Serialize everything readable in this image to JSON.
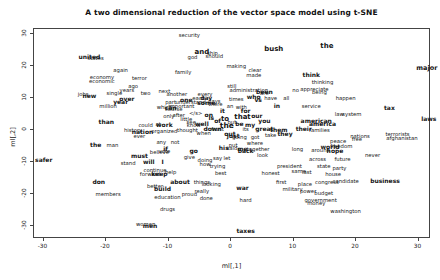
{
  "chart": {
    "title": "A two dimensional reduction of the vector space model using t-SNE",
    "x_axis_label": "ml[,1]",
    "y_axis_label": "ml[,2]"
  },
  "chart_data": {
    "type": "scatter",
    "title": "A two dimensional reduction of the vector space model using t-SNE",
    "xlabel": "ml[,1]",
    "ylabel": "ml[,2]",
    "xlim": [
      -31.5,
      32
    ],
    "ylim": [
      -33,
      31
    ],
    "x_ticks": [
      -30,
      -20,
      -10,
      0,
      10,
      20,
      30
    ],
    "y_ticks": [
      30,
      20,
      10,
      0,
      -10,
      -20,
      -30
    ],
    "grid": false,
    "legend": "none",
    "point_style": "word-labels",
    "points": [
      [
        "security",
        -6.5,
        29,
        0
      ],
      [
        "united",
        -22.5,
        22.5,
        1
      ],
      [
        "states",
        -21.5,
        22,
        0
      ],
      [
        "again",
        -17.5,
        18,
        0
      ],
      [
        "economy",
        -20.5,
        16,
        0
      ],
      [
        "economic",
        -20.5,
        14.8,
        0
      ],
      [
        "terror",
        -14.5,
        15.5,
        0
      ],
      [
        "and",
        -4.5,
        24,
        1,
        7
      ],
      [
        "god",
        -6,
        22.3,
        0
      ],
      [
        "ship",
        -2.8,
        23.5,
        0
      ],
      [
        "should",
        -2.5,
        22.4,
        0
      ],
      [
        "bush",
        7,
        25,
        1,
        7
      ],
      [
        "making",
        1,
        19.5,
        0
      ],
      [
        "clear",
        4,
        18,
        0
      ],
      [
        "made",
        3.8,
        16.5,
        0
      ],
      [
        "the",
        15.5,
        26,
        1,
        7
      ],
      [
        "major",
        31.5,
        19,
        1,
        6.5
      ],
      [
        "family",
        -7.5,
        17.5,
        0
      ],
      [
        "every",
        -4,
        10.5,
        0
      ],
      [
        "each",
        -5,
        9.5,
        0
      ],
      [
        "day",
        -3.8,
        9.8,
        1
      ],
      [
        "days",
        -2.5,
        8.5,
        0
      ],
      [
        "times",
        1,
        9,
        0
      ],
      [
        "vs",
        4.5,
        9,
        1
      ],
      [
        "next",
        -10.5,
        11.5,
        0
      ],
      [
        "another",
        -8.5,
        10.5,
        0
      ],
      [
        "one",
        -7,
        9,
        1
      ],
      [
        "important",
        -7.8,
        7,
        0
      ],
      [
        "can",
        -9.5,
        6.5,
        1
      ],
      [
        "still",
        0.3,
        13,
        0
      ],
      [
        "administration",
        3,
        12,
        0
      ],
      [
        "been",
        5.5,
        11.5,
        1
      ],
      [
        "no",
        10.5,
        12,
        0
      ],
      [
        "are",
        5.5,
        11,
        0
      ],
      [
        "who",
        3.8,
        10,
        1
      ],
      [
        "have",
        6.5,
        9.5,
        0
      ],
      [
        "all",
        9,
        9.5,
        0
      ],
      [
        "in",
        7.5,
        7.3,
        1
      ],
      [
        "with",
        1.8,
        6.5,
        0
      ],
      [
        "jobs",
        -23.5,
        10.5,
        0
      ],
      [
        "new",
        -22.5,
        10.3,
        1
      ],
      [
        "single",
        -18.5,
        11,
        0
      ],
      [
        "years",
        -16.5,
        12,
        0
      ],
      [
        "ago",
        -15.5,
        13.2,
        0
      ],
      [
        "over",
        -16.5,
        9.5,
        1
      ],
      [
        "two",
        -13.5,
        11,
        0
      ],
      [
        "year",
        -17.5,
        8.3,
        1
      ],
      [
        "million",
        -19.5,
        6.8,
        0
      ],
      [
        "think",
        13,
        17,
        1
      ],
      [
        "thinking",
        14.8,
        14.5,
        0
      ],
      [
        "appreciate",
        13.5,
        12.3,
        0
      ],
      [
        "being",
        14.3,
        11.3,
        0
      ],
      [
        "happen",
        18.5,
        9.5,
        0
      ],
      [
        "tax",
        25.5,
        6.5,
        1
      ],
      [
        "service",
        13,
        7,
        0
      ],
      [
        "law",
        17.5,
        4.5,
        0
      ],
      [
        "system",
        19.5,
        4.5,
        0
      ],
      [
        "laws",
        31.8,
        3,
        1
      ],
      [
        "part",
        -9.5,
        8,
        0
      ],
      [
        "understand",
        -6.3,
        8,
        0
      ],
      [
        "some",
        -3.8,
        8.2,
        1
      ],
      [
        "there",
        -2.3,
        7.5,
        0
      ],
      [
        "an",
        0,
        6.8,
        0
      ],
      [
        "which",
        -10.5,
        6.7,
        0
      ],
      [
        "course",
        -9,
        5.8,
        0
      ],
      [
        "only",
        -9.8,
        3.8,
        0
      ],
      [
        "little",
        -7,
        2.8,
        0
      ],
      [
        "see",
        -6.2,
        2,
        0
      ],
      [
        "work",
        -10.5,
        1.2,
        1
      ],
      [
        "at",
        -11.5,
        1.4,
        0
      ],
      [
        "after",
        -8.2,
        4,
        0
      ],
      [
        "&lt;/s&gt;",
        -5.5,
        4.7,
        0
      ],
      [
        "on",
        -3.4,
        4.4,
        1
      ],
      [
        "it",
        -1.2,
        5.6,
        1
      ],
      [
        "for",
        2.5,
        5.7,
        1
      ],
      [
        "our",
        4.3,
        4.2,
        1
      ],
      [
        "you",
        5.5,
        2.6,
        1
      ],
      [
        "my",
        3.2,
        1.2,
        1
      ],
      [
        "be",
        1.5,
        1.6,
        1
      ],
      [
        "but",
        0.3,
        1.8,
        0
      ],
      [
        "to",
        -0.8,
        3.2,
        1,
        7
      ],
      [
        "that",
        2,
        3.8,
        1,
        7
      ],
      [
        "of",
        -2,
        2.6,
        1
      ],
      [
        "is",
        -3,
        3.4,
        1
      ],
      [
        "the",
        -0.5,
        0.8,
        1,
        7.5
      ],
      [
        "know",
        -5.8,
        0.8,
        0
      ],
      [
        "well",
        -4.5,
        1.5,
        1
      ],
      [
        "thought",
        -6.8,
        -0.6,
        0
      ],
      [
        "front",
        -2,
        -0.2,
        0
      ],
      [
        "down",
        -2.8,
        0,
        1
      ],
      [
        "its",
        2.5,
        -0.2,
        0
      ],
      [
        "great",
        5.5,
        0,
        1
      ],
      [
        "them",
        7.8,
        -0.3,
        1
      ],
      [
        "they",
        8.8,
        -1.5,
        1
      ],
      [
        "when",
        -4.2,
        -1.6,
        0
      ],
      [
        "just",
        0.5,
        -2.2,
        1
      ],
      [
        "out",
        0,
        -1.5,
        1
      ],
      [
        "going",
        1.5,
        -2.8,
        0
      ],
      [
        "got",
        4,
        -2.8,
        0
      ],
      [
        "take",
        6.5,
        -2.2,
        0
      ],
      [
        "where",
        4,
        -4.8,
        0
      ],
      [
        "his",
        -1,
        -6,
        1
      ],
      [
        "said",
        0.3,
        -6.3,
        0
      ],
      [
        "me",
        2,
        -6.2,
        1
      ],
      [
        "put",
        0.5,
        -5.2,
        0
      ],
      [
        "back",
        2.5,
        -6.8,
        1
      ],
      [
        "together",
        4.5,
        -6.6,
        0
      ],
      [
        "look",
        5.2,
        -8.3,
        0
      ],
      [
        "go",
        -5.8,
        -7,
        1
      ],
      [
        "vote",
        -10.5,
        -7.3,
        0
      ],
      [
        "give",
        -6.5,
        -9.2,
        0
      ],
      [
        "doing",
        -4,
        -10,
        0
      ],
      [
        "say",
        -2,
        -9.5,
        0
      ],
      [
        "let",
        -0.5,
        -9.5,
        0
      ],
      [
        "how",
        -4,
        -11.3,
        0
      ],
      [
        "trying",
        -2,
        -12,
        0
      ],
      [
        "best",
        -1.5,
        -14,
        0
      ],
      [
        "honest",
        6.5,
        -14,
        0
      ],
      [
        "first",
        8.2,
        -17,
        0
      ],
      [
        "same",
        11,
        -13.5,
        0
      ],
      [
        "last",
        12.3,
        -13.8,
        0
      ],
      [
        "place",
        12,
        -17.5,
        0
      ],
      [
        "power",
        12.5,
        -19.8,
        0
      ],
      [
        "military",
        10,
        -19.2,
        0
      ],
      [
        "war",
        2,
        -18.5,
        1
      ],
      [
        "hard",
        2.5,
        -22.5,
        0
      ],
      [
        "about",
        -8,
        -16.6,
        1
      ],
      [
        "things",
        -4.5,
        -16.8,
        0
      ],
      [
        "looking",
        -3,
        -17.4,
        0
      ],
      [
        "really",
        -4.5,
        -19.8,
        0
      ],
      [
        "done",
        -3.8,
        -21.8,
        0
      ],
      [
        "proud",
        -6.5,
        -20.6,
        0
      ],
      [
        "education",
        -10,
        -21.6,
        0
      ],
      [
        "drugs",
        -10,
        -25.4,
        0
      ],
      [
        "members",
        -19.5,
        -20.6,
        0
      ],
      [
        "don",
        -21,
        -16.6,
        1
      ],
      [
        "better",
        -12,
        -18.2,
        0
      ],
      [
        "build",
        -10.8,
        -18.8,
        1
      ],
      [
        "keep",
        -11.3,
        -14.1,
        1
      ],
      [
        "help",
        -9.5,
        -13.8,
        0
      ],
      [
        "forward",
        -12.8,
        -14.4,
        0
      ],
      [
        "continue",
        -12,
        -13,
        0
      ],
      [
        "will",
        -13,
        -10.4,
        1
      ],
      [
        "I",
        -10.8,
        -10.4,
        1
      ],
      [
        "stand",
        -16.3,
        -10.8,
        0
      ],
      [
        "must",
        -14.5,
        -8.4,
        1
      ],
      [
        "believe",
        -11.3,
        -7.5,
        0
      ],
      [
        "if",
        -10.3,
        -6.2,
        1
      ],
      [
        "any",
        -11,
        -4.5,
        0
      ],
      [
        "not",
        -8.8,
        -4.4,
        0
      ],
      [
        "the",
        -21.5,
        -5,
        1
      ],
      [
        "man",
        -18.8,
        -5.2,
        0
      ],
      [
        "than",
        -19.8,
        2.2,
        1
      ],
      [
        "history",
        -15.5,
        -0.5,
        0
      ],
      [
        "nation",
        -14,
        -1,
        1
      ],
      [
        "ever",
        -14.5,
        -2.5,
        0
      ],
      [
        "could",
        -13.5,
        1,
        0
      ],
      [
        "organized",
        -10.5,
        -0.8,
        0
      ],
      [
        "safer",
        -29.8,
        -9.8,
        1
      ],
      [
        "women",
        -13.5,
        -30,
        0
      ],
      [
        "men",
        -12.8,
        -30.2,
        1
      ],
      [
        "taxes",
        2.5,
        -32,
        1
      ],
      [
        "president",
        9.5,
        -12,
        0
      ],
      [
        "state",
        15,
        -12,
        0
      ],
      [
        "party",
        17.5,
        -12.5,
        0
      ],
      [
        "house",
        16.5,
        -14.3,
        0
      ],
      [
        "congress",
        15.5,
        -16.8,
        0
      ],
      [
        "candidate",
        18.5,
        -16.5,
        0
      ],
      [
        "business",
        24.8,
        -16.2,
        1
      ],
      [
        "budget",
        15,
        -20.3,
        0
      ],
      [
        "government",
        14.5,
        -22.5,
        0
      ],
      [
        "money",
        13.8,
        -23.5,
        0
      ],
      [
        "washington",
        18.5,
        -25.8,
        0
      ],
      [
        "world",
        16,
        -5.5,
        1
      ],
      [
        "freedom",
        17.8,
        -5.5,
        0
      ],
      [
        "peace",
        17.3,
        -4,
        0
      ],
      [
        "hope",
        16.8,
        -6.8,
        1
      ],
      [
        "around",
        14.5,
        -7,
        0
      ],
      [
        "across",
        14,
        -9.8,
        0
      ],
      [
        "future",
        18,
        -9.6,
        0
      ],
      [
        "never",
        22.8,
        -8.5,
        0
      ],
      [
        "long",
        10.8,
        -6.5,
        0
      ],
      [
        "american",
        13.8,
        2.5,
        1
      ],
      [
        "america",
        14.8,
        1.5,
        1
      ],
      [
        "families",
        14.3,
        -0.5,
        0
      ],
      [
        "their",
        11.8,
        0,
        1
      ],
      [
        "nations",
        20.8,
        -2.5,
        0
      ],
      [
        "free",
        20.3,
        -3.5,
        0
      ],
      [
        "terrorists",
        26.8,
        -2,
        0
      ],
      [
        "afghanistan",
        27.5,
        -3,
        0
      ]
    ]
  }
}
